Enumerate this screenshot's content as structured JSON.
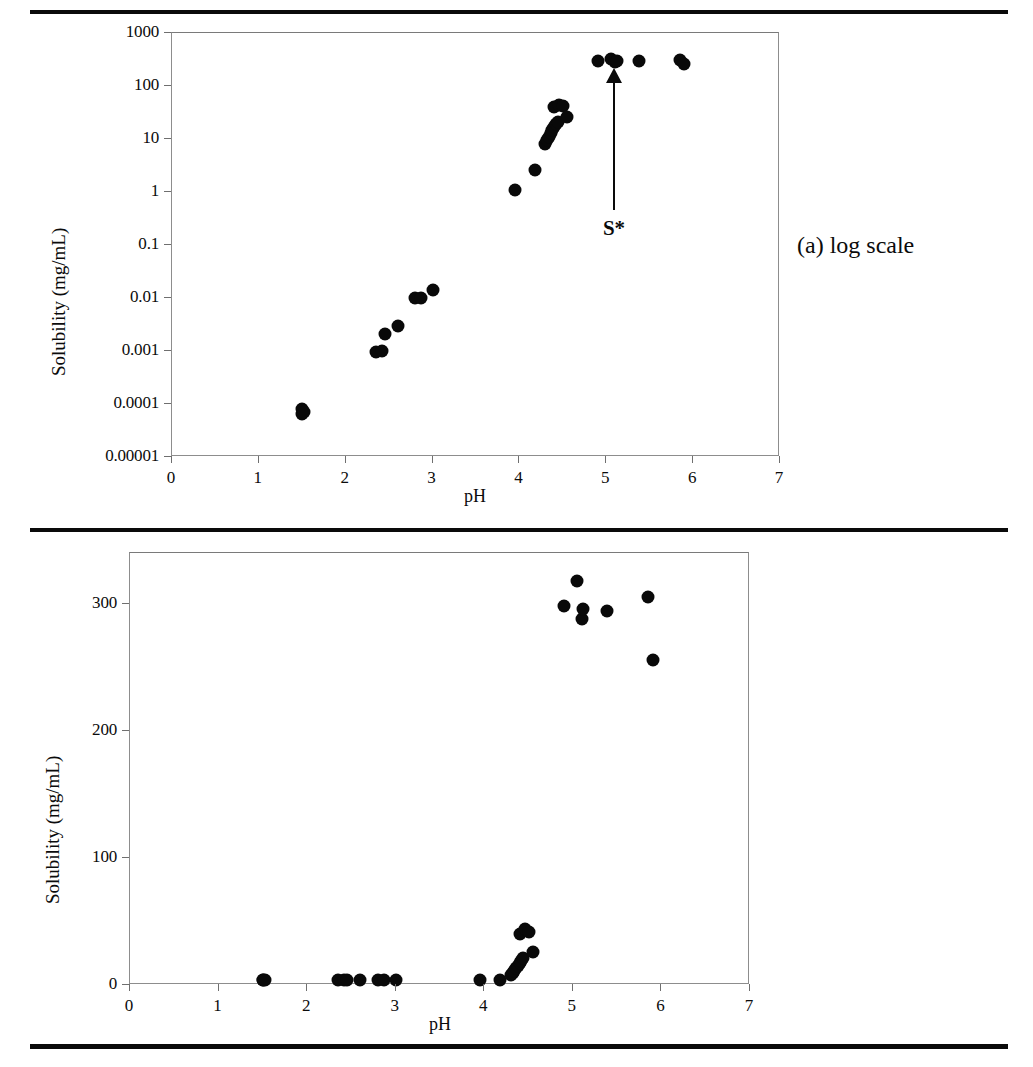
{
  "figure": {
    "panels": [
      {
        "id": "panel-a",
        "caption": "(a) log scale",
        "scale": "log",
        "annotation": {
          "label": "S*",
          "target_ph": 5.1
        }
      },
      {
        "id": "panel-b",
        "caption": "(b) linear scale",
        "scale": "linear"
      }
    ]
  },
  "chart_data": [
    {
      "type": "scatter",
      "title": "(a) log scale",
      "xlabel": "pH",
      "ylabel": "Solubility (mg/mL)",
      "xlim": [
        0,
        7
      ],
      "ylim": [
        1e-05,
        1000
      ],
      "yscale": "log",
      "xticks": [
        "0",
        "1",
        "2",
        "3",
        "4",
        "5",
        "6",
        "7"
      ],
      "yticks": [
        "0.00001",
        "0.0001",
        "0.001",
        "0.01",
        "0.1",
        "1",
        "10",
        "100",
        "1000"
      ],
      "grid": false,
      "legend": false,
      "marker": "filled-circle",
      "marker_color": "#090909",
      "annotations": [
        {
          "text": "S*",
          "x": 5.1,
          "y": 300,
          "arrow": "up"
        }
      ],
      "points": [
        {
          "x": 1.5,
          "y": 6.5e-05
        },
        {
          "x": 1.5,
          "y": 8e-05
        },
        {
          "x": 1.52,
          "y": 7.2e-05
        },
        {
          "x": 2.35,
          "y": 0.00095
        },
        {
          "x": 2.42,
          "y": 0.00098
        },
        {
          "x": 2.45,
          "y": 0.0021
        },
        {
          "x": 2.6,
          "y": 0.0029
        },
        {
          "x": 2.8,
          "y": 0.0098
        },
        {
          "x": 2.87,
          "y": 0.01
        },
        {
          "x": 3.0,
          "y": 0.014
        },
        {
          "x": 3.95,
          "y": 1.1
        },
        {
          "x": 4.18,
          "y": 2.6
        },
        {
          "x": 4.3,
          "y": 8.0
        },
        {
          "x": 4.32,
          "y": 9.5
        },
        {
          "x": 4.34,
          "y": 11.0
        },
        {
          "x": 4.36,
          "y": 13.0
        },
        {
          "x": 4.38,
          "y": 15.0
        },
        {
          "x": 4.4,
          "y": 17.0
        },
        {
          "x": 4.42,
          "y": 19.0
        },
        {
          "x": 4.44,
          "y": 21.0
        },
        {
          "x": 4.4,
          "y": 40.0
        },
        {
          "x": 4.46,
          "y": 44.0
        },
        {
          "x": 4.5,
          "y": 42.0
        },
        {
          "x": 4.55,
          "y": 26.0
        },
        {
          "x": 4.9,
          "y": 298
        },
        {
          "x": 5.05,
          "y": 318
        },
        {
          "x": 5.1,
          "y": 288
        },
        {
          "x": 5.12,
          "y": 296
        },
        {
          "x": 5.38,
          "y": 294
        },
        {
          "x": 5.85,
          "y": 305
        },
        {
          "x": 5.9,
          "y": 256
        }
      ]
    },
    {
      "type": "scatter",
      "title": "(b) linear scale",
      "xlabel": "pH",
      "ylabel": "Solubility (mg/mL)",
      "xlim": [
        0,
        7
      ],
      "ylim": [
        0,
        340
      ],
      "yscale": "linear",
      "xticks": [
        "0",
        "1",
        "2",
        "3",
        "4",
        "5",
        "6",
        "7"
      ],
      "yticks": [
        "0",
        "100",
        "200",
        "300"
      ],
      "grid": false,
      "legend": false,
      "marker": "filled-circle",
      "marker_color": "#090909",
      "points": [
        {
          "x": 1.5,
          "y": 6.5e-05
        },
        {
          "x": 1.5,
          "y": 8e-05
        },
        {
          "x": 1.52,
          "y": 7.2e-05
        },
        {
          "x": 2.35,
          "y": 0.00095
        },
        {
          "x": 2.42,
          "y": 0.00098
        },
        {
          "x": 2.45,
          "y": 0.0021
        },
        {
          "x": 2.6,
          "y": 0.0029
        },
        {
          "x": 2.8,
          "y": 0.0098
        },
        {
          "x": 2.87,
          "y": 0.01
        },
        {
          "x": 3.0,
          "y": 0.014
        },
        {
          "x": 3.95,
          "y": 1.1
        },
        {
          "x": 4.18,
          "y": 2.6
        },
        {
          "x": 4.3,
          "y": 8.0
        },
        {
          "x": 4.32,
          "y": 9.5
        },
        {
          "x": 4.34,
          "y": 11.0
        },
        {
          "x": 4.36,
          "y": 13.0
        },
        {
          "x": 4.38,
          "y": 15.0
        },
        {
          "x": 4.4,
          "y": 17.0
        },
        {
          "x": 4.42,
          "y": 19.0
        },
        {
          "x": 4.44,
          "y": 21.0
        },
        {
          "x": 4.4,
          "y": 40.0
        },
        {
          "x": 4.46,
          "y": 44.0
        },
        {
          "x": 4.5,
          "y": 42.0
        },
        {
          "x": 4.55,
          "y": 26.0
        },
        {
          "x": 4.9,
          "y": 298
        },
        {
          "x": 5.05,
          "y": 318
        },
        {
          "x": 5.1,
          "y": 288
        },
        {
          "x": 5.12,
          "y": 296
        },
        {
          "x": 5.38,
          "y": 294
        },
        {
          "x": 5.85,
          "y": 305
        },
        {
          "x": 5.9,
          "y": 256
        }
      ]
    }
  ]
}
